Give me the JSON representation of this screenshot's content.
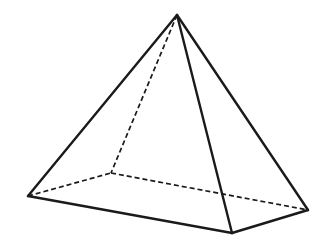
{
  "figure": {
    "name": "square-pyramid",
    "background_color": "#ffffff",
    "line_color": "#1a1a1a",
    "face_color": "#ffffff",
    "solid_stroke_width": 2.4,
    "hidden_stroke_width": 1.7,
    "hidden_dash_pattern": "5 3",
    "canvas": {
      "width": 329,
      "height": 244
    },
    "vertices": {
      "apex": {
        "label": "apex",
        "x": 177,
        "y": 15
      },
      "front": {
        "label": "front-corner",
        "x": 232,
        "y": 233
      },
      "left": {
        "label": "left-corner",
        "x": 28,
        "y": 196
      },
      "right": {
        "label": "right-corner",
        "x": 308,
        "y": 210
      },
      "back": {
        "label": "back-corner",
        "x": 111,
        "y": 173
      }
    },
    "faces": {
      "left_face": "177,15 28,196 232,233",
      "right_face": "177,15 232,233 308,210"
    },
    "edges_solid": [
      {
        "name": "apex-to-left",
        "d": "M 177 15 L 28 196"
      },
      {
        "name": "apex-to-front",
        "d": "M 177 15 L 232 233"
      },
      {
        "name": "apex-to-right",
        "d": "M 177 15 L 308 210"
      },
      {
        "name": "left-to-front",
        "d": "M 28 196 L 232 233"
      },
      {
        "name": "front-to-right",
        "d": "M 232 233 L 308 210"
      }
    ],
    "edges_hidden": [
      {
        "name": "apex-to-back",
        "d": "M 177 15 L 111 173"
      },
      {
        "name": "left-to-back",
        "d": "M 28 196 L 111 173"
      },
      {
        "name": "back-to-right",
        "d": "M 111 173 L 308 210"
      }
    ]
  }
}
